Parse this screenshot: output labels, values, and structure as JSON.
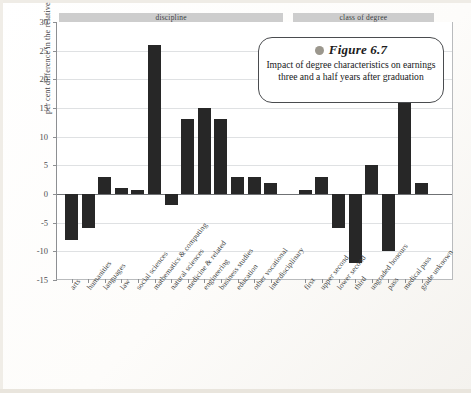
{
  "figure": {
    "bullet_icon": "circle-bullet-icon",
    "title": "Figure 6.7",
    "caption": "Impact of degree characteristics on earnings three and a half years after graduation"
  },
  "axes": {
    "y_title": "per cent difference in the relative earnings",
    "y_ticks": [
      30,
      25,
      20,
      15,
      10,
      5,
      0,
      -5,
      -10,
      -15
    ],
    "y_tick_labels": [
      "30",
      "25",
      "20",
      "15",
      "10",
      "5",
      "0",
      "-5",
      "-10",
      "-15"
    ],
    "ylim": [
      -15,
      30
    ]
  },
  "groups": [
    {
      "name": "discipline-band",
      "label": "discipline"
    },
    {
      "name": "class-of-degree-band",
      "label": "class of degree"
    }
  ],
  "colors": {
    "bar": "#272727",
    "band": "#cdcdcd",
    "grid": "#dfe1e3",
    "axis": "#8d8f92",
    "bullet": "#9b978d",
    "page": "#fbfaf8"
  },
  "chart_data": {
    "type": "bar",
    "title": "Figure 6.7",
    "subtitle": "Impact of degree characteristics on earnings three and a half years after graduation",
    "xlabel": "",
    "ylabel": "per cent difference in the relative earnings",
    "ylim": [
      -15,
      30
    ],
    "yticks": [
      -15,
      -10,
      -5,
      0,
      5,
      10,
      15,
      20,
      25,
      30
    ],
    "grid": true,
    "legend": "none",
    "group_labels": [
      "discipline",
      "class of degree"
    ],
    "categories": [
      "arts",
      "humanities",
      "languages",
      "law",
      "social sciences",
      "mathematics & computing",
      "natural sciences",
      "medicine & related",
      "engineering",
      "business studies",
      "education",
      "other vocational",
      "interdisciplinary",
      "first",
      "upper second",
      "lower second",
      "third",
      "ungraded honours",
      "pass",
      "medical pass",
      "grade unknown"
    ],
    "values": [
      -8,
      -6,
      3,
      1,
      0,
      26,
      -2,
      13,
      15,
      13,
      3,
      3,
      2,
      0,
      3,
      -6,
      -12,
      5,
      -10,
      24,
      2
    ],
    "groups": [
      {
        "label": "discipline",
        "categories": [
          "arts",
          "humanities",
          "languages",
          "law",
          "social sciences",
          "mathematics & computing",
          "natural sciences",
          "medicine & related",
          "engineering",
          "business studies",
          "education",
          "other vocational",
          "interdisciplinary"
        ],
        "values": [
          -8,
          -6,
          3,
          1,
          0,
          26,
          -2,
          13,
          15,
          13,
          3,
          3,
          2
        ]
      },
      {
        "label": "class of degree",
        "categories": [
          "first",
          "upper second",
          "lower second",
          "third",
          "ungraded honours",
          "pass",
          "medical pass",
          "grade unknown"
        ],
        "values": [
          0,
          3,
          -6,
          -12,
          5,
          -10,
          24,
          2
        ]
      }
    ]
  }
}
